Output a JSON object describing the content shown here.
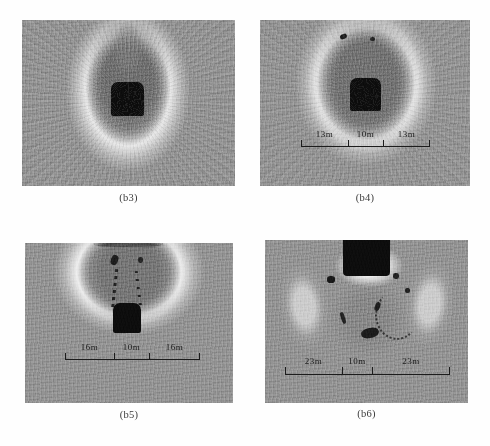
{
  "figure": {
    "panels": [
      {
        "id": "b3",
        "caption": "(b3)",
        "scale_bar": null
      },
      {
        "id": "b4",
        "caption": "(b4)",
        "scale_bar": {
          "segments": [
            "13m",
            "10m",
            "13m"
          ],
          "left_label": "13m",
          "center_label": "10m",
          "right_label": "13m"
        }
      },
      {
        "id": "b5",
        "caption": "(b5)",
        "scale_bar": {
          "segments": [
            "16m",
            "10m",
            "16m"
          ],
          "left_label": "16m",
          "center_label": "10m",
          "right_label": "16m"
        }
      },
      {
        "id": "b6",
        "caption": "(b6)",
        "scale_bar": {
          "segments": [
            "23m",
            "10m",
            "23m"
          ],
          "left_label": "23m",
          "center_label": "10m",
          "right_label": "23m"
        }
      }
    ],
    "colors": {
      "background": "#ffffff",
      "rock_gray": "#8e8e8e",
      "tunnel_black": "#0b0b0b",
      "bright_halo": "#d8d8d8",
      "dark_zone": "#767676",
      "text": "#1c1c1c"
    }
  }
}
